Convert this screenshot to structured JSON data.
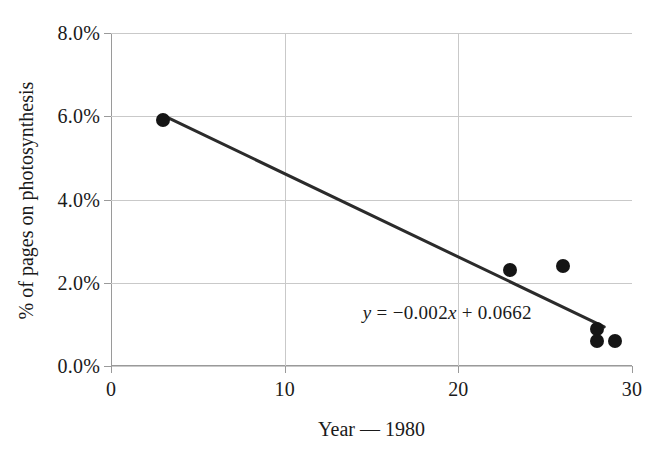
{
  "chart_data": {
    "type": "scatter",
    "title": "",
    "xlabel": "Year — 1980",
    "ylabel": "% of pages on photosynthesis",
    "xlim": [
      0,
      30
    ],
    "ylim": [
      0,
      0.08
    ],
    "grid": true,
    "legend": "none",
    "x_ticks": [
      {
        "value": 0,
        "label": "0"
      },
      {
        "value": 10,
        "label": "10"
      },
      {
        "value": 20,
        "label": "20"
      },
      {
        "value": 30,
        "label": "30"
      }
    ],
    "y_ticks": [
      {
        "value": 0.0,
        "label": "0.0%"
      },
      {
        "value": 0.02,
        "label": "2.0%"
      },
      {
        "value": 0.04,
        "label": "4.0%"
      },
      {
        "value": 0.06,
        "label": "6.0%"
      },
      {
        "value": 0.08,
        "label": "8.0%"
      }
    ],
    "series": [
      {
        "name": "% of pages on photosynthesis",
        "marker": "filled-circle",
        "color": "#151515",
        "points": [
          {
            "x": 3,
            "y": 0.059
          },
          {
            "x": 23,
            "y": 0.023
          },
          {
            "x": 26,
            "y": 0.024
          },
          {
            "x": 28,
            "y": 0.009
          },
          {
            "x": 28,
            "y": 0.006
          },
          {
            "x": 29,
            "y": 0.006
          }
        ]
      }
    ],
    "trendline": {
      "type": "linear",
      "slope": -0.002,
      "intercept": 0.0662,
      "color": "#2b2b2b",
      "x_start": 3,
      "x_end": 28.4
    },
    "annotations": [
      {
        "name": "trendline-equation",
        "text": "y = −0.002x + 0.0662",
        "parts": {
          "y_var": "y",
          "equals": " = ",
          "slope_term": "−0.002",
          "x_var": "x",
          "plus": " + ",
          "intercept": "0.0662"
        },
        "x": 14.5,
        "y": 0.0125
      }
    ]
  },
  "colors": {
    "background": "#ffffff",
    "marker": "#151515",
    "trendline": "#2b2b2b",
    "grid": "#c9c9c9",
    "axis": "#9a9a9a",
    "text": "#1a1a1a"
  }
}
